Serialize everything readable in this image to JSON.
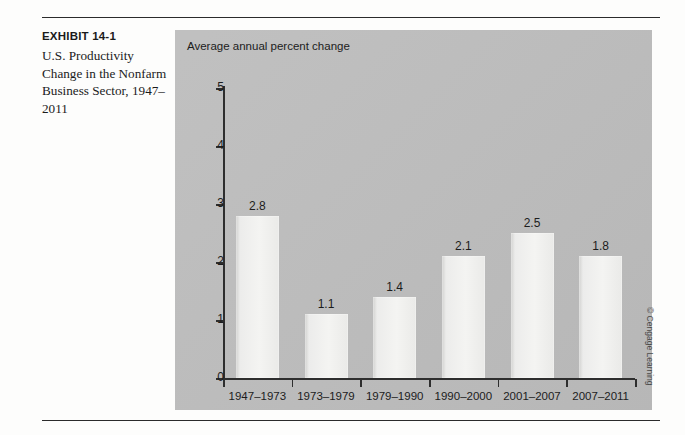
{
  "exhibit": {
    "label": "EXHIBIT 14-1",
    "caption": "U.S. Productivity Change in the Nonfarm Business Sector, 1947–2011"
  },
  "credit": "© Cengage Learning",
  "colors": {
    "panel_background": "#bdbdbd",
    "bar_fill": "#ececea",
    "axis": "#2e2e2e",
    "text": "#1c1c1c",
    "rule": "#2b2b2b"
  },
  "chart_data": {
    "type": "bar",
    "title": "",
    "ylabel": "Average annual percent change",
    "xlabel": "",
    "ylim": [
      0,
      5
    ],
    "yticks": [
      0,
      1,
      2,
      3,
      4,
      5
    ],
    "grid": false,
    "legend": "none",
    "categories": [
      "1947–1973",
      "1973–1979",
      "1979–1990",
      "1990–2000",
      "2001–2007",
      "2007–2011"
    ],
    "values": [
      2.8,
      1.1,
      1.4,
      2.1,
      2.5,
      1.8
    ],
    "data_labels": [
      "2.8",
      "1.1",
      "1.4",
      "2.1",
      "2.5",
      "1.8"
    ],
    "drawn_heights": [
      2.8,
      1.1,
      1.4,
      2.1,
      2.5,
      2.1
    ]
  }
}
